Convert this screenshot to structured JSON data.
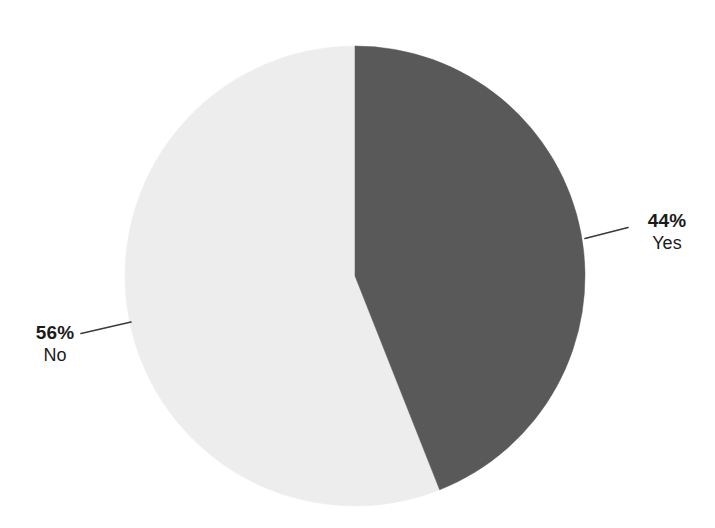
{
  "chart_data": {
    "type": "pie",
    "title": "",
    "subtitle": "",
    "xlabel": "",
    "ylabel": "",
    "legend_position": "none",
    "grid": false,
    "labels": [
      "Yes",
      "No"
    ],
    "values": [
      44,
      56
    ],
    "value_labels": [
      "44%",
      "56%"
    ],
    "units": "percent",
    "slices": [
      {
        "name": "Yes",
        "value": 44,
        "value_label": "44%",
        "color": "#595959",
        "start_angle_deg": 0,
        "sweep_deg": 158.4,
        "label_side": "right"
      },
      {
        "name": "No",
        "value": 56,
        "value_label": "56%",
        "color": "#ededed",
        "start_angle_deg": 158.4,
        "sweep_deg": 201.6,
        "label_side": "left"
      }
    ],
    "start_angle_deg": 0,
    "direction": "clockwise",
    "total": 100
  },
  "geometry": {
    "center_x": 355,
    "center_y": 276,
    "radius": 230
  },
  "colors": {
    "yes_slice": "#595959",
    "no_slice": "#ededed",
    "leader_line": "#3a3a3a",
    "text": "#1b1b1b",
    "background": "#ffffff"
  },
  "labels": {
    "yes": {
      "value": "44%",
      "name": "Yes"
    },
    "no": {
      "value": "56%",
      "name": "No"
    }
  }
}
